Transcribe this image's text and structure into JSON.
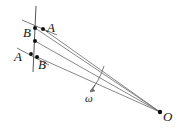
{
  "figure": {
    "kind": "geometry-diagram",
    "width": 179,
    "height": 130,
    "background_color": "#ffffff",
    "stroke_color": "#4a4a4a",
    "text_color": "#141414",
    "point_color": "#111111"
  },
  "labels": {
    "a_upper": "A",
    "b_upper": "B",
    "a_lower": "A",
    "b_lower": "B",
    "omega": "ω",
    "origin": "O"
  },
  "geometry": {
    "axis_line": {
      "x1": 36,
      "y1": 6,
      "x2": 33,
      "y2": 72
    },
    "origin_point": {
      "x": 160,
      "y": 112
    },
    "marked_points": [
      {
        "name": "A-upper",
        "x": 43,
        "y": 29
      },
      {
        "name": "B-upper",
        "x": 35,
        "y": 28
      },
      {
        "name": "mid",
        "x": 35,
        "y": 41
      },
      {
        "name": "A-lower",
        "x": 31,
        "y": 54
      },
      {
        "name": "B-lower",
        "x": 37,
        "y": 57
      }
    ],
    "tick_upper": {
      "x1": 22,
      "y1": 20,
      "x2": 56,
      "y2": 34
    },
    "tick_lower": {
      "x1": 18,
      "y1": 48,
      "x2": 48,
      "y2": 64
    },
    "rays_to_origin": [
      {
        "from_x": 43,
        "from_y": 29
      },
      {
        "from_x": 35,
        "from_y": 28
      },
      {
        "from_x": 35,
        "from_y": 41
      },
      {
        "from_x": 37,
        "from_y": 57
      }
    ],
    "omega_arc": {
      "start_x": 104,
      "start_y": 66,
      "end_x": 89,
      "end_y": 92
    }
  },
  "label_positions": {
    "a_upper": {
      "left": 47,
      "top": 22
    },
    "b_upper": {
      "left": 24,
      "top": 26
    },
    "a_lower": {
      "left": 15,
      "top": 51
    },
    "b_lower": {
      "left": 38,
      "top": 59
    },
    "omega": {
      "left": 85,
      "top": 93
    },
    "origin": {
      "left": 163,
      "top": 111
    }
  }
}
